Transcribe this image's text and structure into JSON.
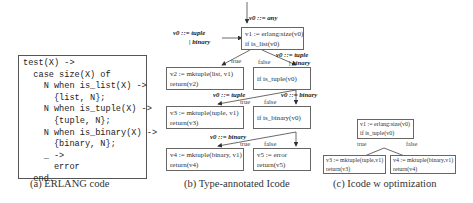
{
  "panel_a": {
    "code_lines": [
      "test(X) ->",
      "  case size(X) of",
      "    N when is_list(X) ->",
      "      {list, N};",
      "    N when is_tuple(X) ->",
      "      {tuple, N};",
      "    N when is_binary(X) ->",
      "      {binary, N};",
      "    _ ->",
      "      error",
      "  end."
    ],
    "caption": "(a) ERLANG code"
  },
  "panel_b": {
    "caption": "(b) Type-annotated Icode",
    "entry_annotation": "v0 ::= any",
    "nodes": {
      "n1": [
        "v1 := erlang:size(v0)",
        "if is_list(v0)"
      ],
      "n2": [
        "v2 := mktuple(list, v1)",
        "return(v2)"
      ],
      "n3": [
        "if is_tuple(v0)"
      ],
      "n4": [
        "v3 := mktuple(tuple, v1)",
        "return(v3)"
      ],
      "n5": [
        "if is_binary(v0)"
      ],
      "n6": [
        "v4 := mktuple(binary, v1)",
        "return(v4)"
      ],
      "n7": [
        "v5 := error",
        "return(v5)"
      ]
    },
    "edge_labels": {
      "n1_true": "true",
      "n1_false": "false",
      "n3_true": "true",
      "n3_false": "false",
      "n5_true": "true",
      "n5_false": "false"
    },
    "annotations": {
      "n1_in_left_1": "v0 ::= tuple",
      "n1_in_left_2": "| binary",
      "n3_in_1": "v0 ::= tuple",
      "n3_in_2": "| binary",
      "n4_in": "v0 ::= tuple",
      "n5_in": "v0 ::= binary",
      "n6_in": "v0 ::= binary"
    }
  },
  "panel_c": {
    "caption": "(c) Icode w optimization",
    "nodes": {
      "n1": [
        "v1 := erlang:size(v0)",
        "if is_tuple(v0)"
      ],
      "n2": [
        "v3 := mktuple(tuple,v1)",
        "return(v3)"
      ],
      "n3": [
        "v4 := mktuple(binary,v1)",
        "return(v4)"
      ]
    },
    "edge_labels": {
      "true": "true",
      "false": "false"
    }
  }
}
